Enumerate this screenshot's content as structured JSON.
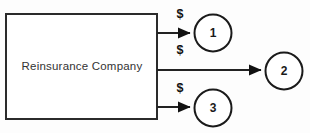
{
  "diagram": {
    "type": "flow-diagram",
    "background_color": "#fdfdfd",
    "line_color": "#222222",
    "entity": {
      "label": "Reinsurance Company",
      "shape": "rectangle",
      "x": 6,
      "y": 14,
      "width": 151,
      "height": 105,
      "label_x": 82,
      "label_y": 67
    },
    "nodes": [
      {
        "label": "1",
        "shape": "circle",
        "cx": 213,
        "cy": 33,
        "r": 18.5
      },
      {
        "label": "2",
        "shape": "circle",
        "cx": 284,
        "cy": 71,
        "r": 18.5
      },
      {
        "label": "3",
        "shape": "circle",
        "cx": 213,
        "cy": 108,
        "r": 18.5
      }
    ],
    "flows": [
      {
        "name": "flow-to-node-1",
        "from_x": 157,
        "from_y": 33,
        "to_x": 193,
        "to_y": 33
      },
      {
        "name": "flow-to-node-2",
        "from_x": 157,
        "from_y": 70,
        "to_x": 264,
        "to_y": 70
      },
      {
        "name": "flow-to-node-3",
        "from_x": 157,
        "from_y": 107,
        "to_x": 193,
        "to_y": 107
      }
    ],
    "money_labels": [
      {
        "label": "$",
        "x": 180,
        "y": 18
      },
      {
        "label": "$",
        "x": 180,
        "y": 54
      },
      {
        "label": "$",
        "x": 180,
        "y": 92
      }
    ]
  }
}
